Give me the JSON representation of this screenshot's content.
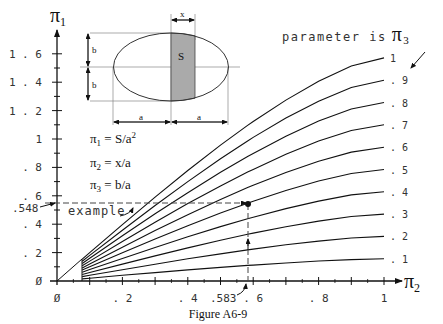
{
  "figure": {
    "caption": "Figure A6-9",
    "y_axis_symbol": "π",
    "y_axis_sub": "1",
    "x_axis_symbol": "π",
    "x_axis_sub": "2",
    "parameter_note": "parameter is",
    "parameter_symbol": "π",
    "parameter_sub": "3",
    "example_label": "example",
    "example_y_label": ".548",
    "example_x_label": ".583"
  },
  "diagram": {
    "strip_label": "S",
    "x_dim": "x",
    "b_top": "b",
    "b_bottom": "b",
    "a_left": "a",
    "a_right": "a"
  },
  "equations": [
    {
      "lhs": "π",
      "sub": "1",
      "rhs": " = S/a",
      "sup": "2"
    },
    {
      "lhs": "π",
      "sub": "2",
      "rhs": " = x/a",
      "sup": ""
    },
    {
      "lhs": "π",
      "sub": "3",
      "rhs": " = b/a",
      "sup": ""
    }
  ],
  "chart_data": {
    "type": "line",
    "title": "Figure A6-9",
    "xlabel": "π2 = x/a",
    "ylabel": "π1 = S/a²",
    "xlim": [
      0,
      1
    ],
    "ylim": [
      0,
      1.7
    ],
    "x_ticks": [
      "0",
      ".2",
      ".4",
      ".6",
      ".8",
      "1"
    ],
    "y_ticks": [
      "0",
      ".2",
      ".4",
      ".6",
      ".8",
      "1",
      "1.2",
      "1.4",
      "1.6"
    ],
    "x_tick_values": [
      0,
      0.2,
      0.4,
      0.6,
      0.8,
      1.0
    ],
    "y_tick_values": [
      0,
      0.2,
      0.4,
      0.6,
      0.8,
      1.0,
      1.2,
      1.4,
      1.6
    ],
    "legend": "parameter is π3",
    "x_start": 0.077,
    "x": [
      0.077,
      0.1,
      0.2,
      0.3,
      0.4,
      0.5,
      0.583,
      0.6,
      0.7,
      0.8,
      0.9,
      1.0
    ],
    "series": [
      {
        "name": "1",
        "values": [
          0.154,
          0.2,
          0.397,
          0.591,
          0.778,
          0.957,
          1.096,
          1.123,
          1.274,
          1.407,
          1.514,
          1.571
        ]
      },
      {
        "name": ".9",
        "values": [
          0.139,
          0.18,
          0.357,
          0.532,
          0.7,
          0.861,
          0.986,
          1.011,
          1.147,
          1.266,
          1.363,
          1.414
        ]
      },
      {
        "name": ".8",
        "values": [
          0.123,
          0.16,
          0.318,
          0.473,
          0.622,
          0.766,
          0.877,
          0.898,
          1.019,
          1.126,
          1.211,
          1.257
        ]
      },
      {
        "name": ".7",
        "values": [
          0.108,
          0.14,
          0.278,
          0.414,
          0.545,
          0.67,
          0.767,
          0.786,
          0.892,
          0.985,
          1.06,
          1.1
        ]
      },
      {
        "name": ".6",
        "values": [
          0.092,
          0.12,
          0.238,
          0.355,
          0.467,
          0.574,
          0.658,
          0.674,
          0.764,
          0.844,
          0.908,
          0.942
        ]
      },
      {
        "name": ".5",
        "values": [
          0.077,
          0.1,
          0.199,
          0.296,
          0.389,
          0.479,
          0.548,
          0.562,
          0.637,
          0.704,
          0.757,
          0.785
        ]
      },
      {
        "name": ".4",
        "values": [
          0.062,
          0.08,
          0.159,
          0.236,
          0.311,
          0.383,
          0.438,
          0.449,
          0.51,
          0.563,
          0.606,
          0.628
        ]
      },
      {
        "name": ".3",
        "values": [
          0.046,
          0.06,
          0.119,
          0.177,
          0.233,
          0.287,
          0.329,
          0.337,
          0.382,
          0.422,
          0.454,
          0.471
        ]
      },
      {
        "name": ".2",
        "values": [
          0.031,
          0.04,
          0.079,
          0.118,
          0.156,
          0.191,
          0.219,
          0.225,
          0.255,
          0.281,
          0.303,
          0.314
        ]
      },
      {
        "name": ".1",
        "values": [
          0.015,
          0.02,
          0.04,
          0.059,
          0.078,
          0.096,
          0.11,
          0.112,
          0.127,
          0.141,
          0.151,
          0.157
        ]
      }
    ],
    "annotations": [
      {
        "text": "example",
        "x": 0.583,
        "y": 0.548,
        "param": ".5"
      },
      {
        "text": ".548",
        "axis": "y"
      },
      {
        "text": ".583",
        "axis": "x"
      }
    ],
    "grid": false
  }
}
